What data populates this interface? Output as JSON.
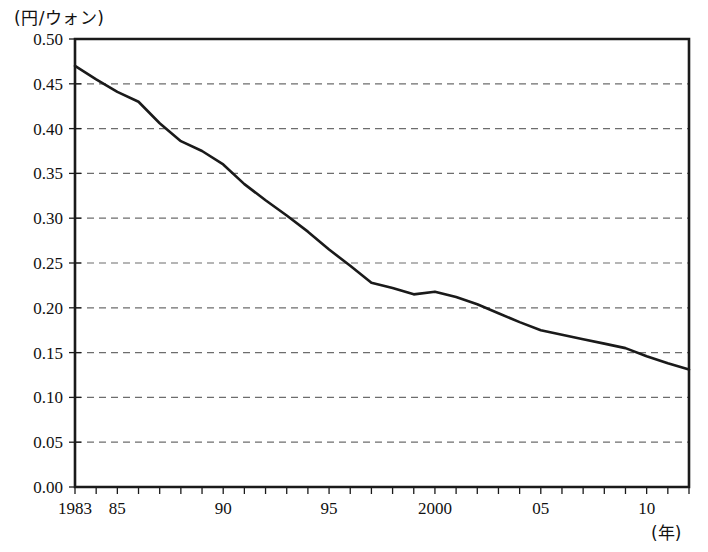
{
  "chart_data": {
    "type": "line",
    "title": "",
    "subtitle": "",
    "ylabel": "(円/ウォン)",
    "xlabel": "(年)",
    "ylim": [
      0.0,
      0.5
    ],
    "xlim": [
      1983,
      2012
    ],
    "grid": true,
    "legend": false,
    "y_ticks": [
      "0.00",
      "0.05",
      "0.10",
      "0.15",
      "0.20",
      "0.25",
      "0.30",
      "0.35",
      "0.40",
      "0.45",
      "0.50"
    ],
    "y_tick_values": [
      0.0,
      0.05,
      0.1,
      0.15,
      0.2,
      0.25,
      0.3,
      0.35,
      0.4,
      0.45,
      0.5
    ],
    "x_tick_labels": [
      {
        "year": 1983,
        "label": "1983"
      },
      {
        "year": 1985,
        "label": "85"
      },
      {
        "year": 1990,
        "label": "90"
      },
      {
        "year": 1995,
        "label": "95"
      },
      {
        "year": 2000,
        "label": "2000"
      },
      {
        "year": 2005,
        "label": "05"
      },
      {
        "year": 2010,
        "label": "10"
      }
    ],
    "x": [
      1983,
      1984,
      1985,
      1986,
      1987,
      1988,
      1989,
      1990,
      1991,
      1992,
      1993,
      1994,
      1995,
      1996,
      1997,
      1998,
      1999,
      2000,
      2001,
      2002,
      2003,
      2004,
      2005,
      2006,
      2007,
      2008,
      2009,
      2010,
      2011,
      2012
    ],
    "series": [
      {
        "name": "円/ウォン",
        "values": [
          0.47,
          0.455,
          0.441,
          0.43,
          0.406,
          0.386,
          0.375,
          0.36,
          0.338,
          0.32,
          0.303,
          0.285,
          0.265,
          0.247,
          0.228,
          0.222,
          0.215,
          0.218,
          0.212,
          0.204,
          0.194,
          0.184,
          0.175,
          0.17,
          0.165,
          0.16,
          0.155,
          0.146,
          0.138,
          0.131
        ]
      }
    ]
  },
  "colors": {
    "line": "#1a1a1a",
    "axis": "#1a1a1a",
    "grid": "#6d6d6d",
    "background": "#ffffff"
  },
  "geometry": {
    "plot_left": 75,
    "plot_right": 689,
    "plot_top": 39,
    "plot_bottom": 487
  }
}
